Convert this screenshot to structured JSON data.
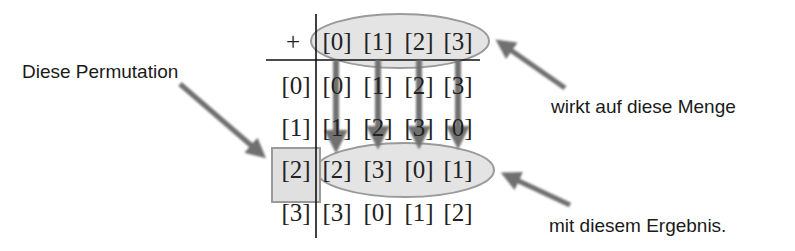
{
  "table": {
    "operator": "+",
    "col_headers": [
      "[0]",
      "[1]",
      "[2]",
      "[3]"
    ],
    "row_headers": [
      "[0]",
      "[1]",
      "[2]",
      "[3]"
    ],
    "rows": [
      [
        "[0]",
        "[1]",
        "[2]",
        "[3]"
      ],
      [
        "[1]",
        "[2]",
        "[3]",
        "[0]"
      ],
      [
        "[2]",
        "[3]",
        "[0]",
        "[1]"
      ],
      [
        "[3]",
        "[0]",
        "[1]",
        "[2]"
      ]
    ],
    "highlighted_row_index": 2
  },
  "annotations": {
    "permutation_label": "Diese Permutation",
    "set_label": "wirkt auf diese Menge",
    "result_label": "mit diesem Ergebnis."
  },
  "colors": {
    "highlight_fill": "#e4e4e4",
    "highlight_stroke": "#9a9a9a",
    "arrow": "#6f6f6f",
    "grid_line": "#111111",
    "text": "#222222"
  }
}
